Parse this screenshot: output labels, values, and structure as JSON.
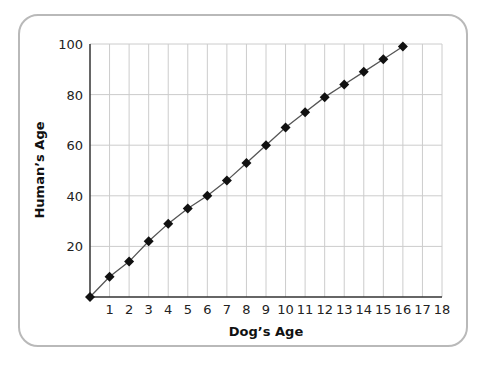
{
  "chart_data": {
    "type": "line",
    "title": "",
    "xlabel": "Dog’s Age",
    "ylabel": "Human’s Age",
    "xlim": [
      0,
      18
    ],
    "ylim": [
      0,
      100
    ],
    "x_ticks": [
      1,
      2,
      3,
      4,
      5,
      6,
      7,
      8,
      9,
      10,
      11,
      12,
      13,
      14,
      15,
      16,
      17,
      18
    ],
    "y_ticks": [
      20,
      40,
      60,
      80,
      100
    ],
    "grid": true,
    "legend": null,
    "marker": "diamond",
    "series": [
      {
        "name": "Human's Age",
        "x": [
          0,
          1,
          2,
          3,
          4,
          5,
          6,
          7,
          8,
          9,
          10,
          11,
          12,
          13,
          14,
          15,
          16
        ],
        "values": [
          0,
          8,
          14,
          22,
          29,
          35,
          40,
          46,
          53,
          60,
          67,
          73,
          79,
          84,
          89,
          94,
          99
        ]
      }
    ]
  },
  "colors": {
    "line": "#555555",
    "marker": "#111111",
    "grid": "#cccccc",
    "axis": "#333333",
    "frame": "#b9b9b9"
  }
}
